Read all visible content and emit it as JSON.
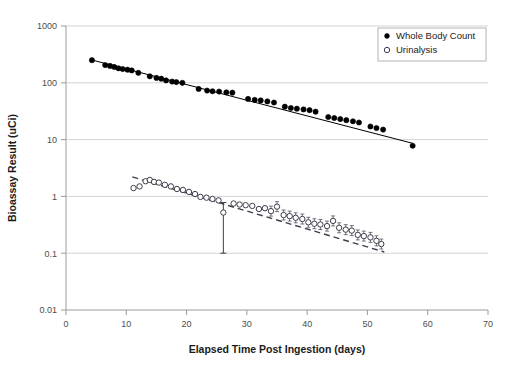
{
  "chart_data": {
    "type": "scatter",
    "title": "",
    "xlabel": "Elapsed Time Post Ingestion (days)",
    "ylabel": "Bioassay Result (uCi)",
    "xlim": [
      0,
      70
    ],
    "ylim": [
      0.01,
      1000
    ],
    "yscale": "log",
    "xscale": "linear",
    "grid": "horizontal-major",
    "legend_position": "top-right",
    "xticks": [
      "0",
      "10",
      "20",
      "30",
      "40",
      "50",
      "60",
      "70"
    ],
    "xtick_values": [
      0,
      10,
      20,
      30,
      40,
      50,
      60,
      70
    ],
    "yticks": [
      "0.01",
      "0.1",
      "1",
      "10",
      "100",
      "1000"
    ],
    "ytick_values": [
      0.01,
      0.1,
      1,
      10,
      100,
      1000
    ],
    "series": [
      {
        "name": "Whole Body Count",
        "marker": "filled-circle",
        "color": "#000000",
        "points": [
          [
            4.3,
            250
          ],
          [
            6.5,
            205
          ],
          [
            7.3,
            198
          ],
          [
            8.0,
            190
          ],
          [
            8.7,
            180
          ],
          [
            9.4,
            175
          ],
          [
            10.2,
            170
          ],
          [
            10.9,
            165
          ],
          [
            12.0,
            150
          ],
          [
            13.9,
            130
          ],
          [
            15.0,
            122
          ],
          [
            15.8,
            118
          ],
          [
            16.6,
            110
          ],
          [
            17.6,
            105
          ],
          [
            18.3,
            103
          ],
          [
            19.3,
            100
          ],
          [
            22.0,
            78
          ],
          [
            23.4,
            73
          ],
          [
            24.3,
            71
          ],
          [
            25.4,
            70
          ],
          [
            26.6,
            68
          ],
          [
            27.6,
            67
          ],
          [
            30.2,
            52
          ],
          [
            31.3,
            50
          ],
          [
            32.3,
            49
          ],
          [
            33.4,
            47
          ],
          [
            34.5,
            45
          ],
          [
            36.3,
            38
          ],
          [
            37.3,
            36
          ],
          [
            38.3,
            35
          ],
          [
            39.4,
            34
          ],
          [
            40.4,
            33
          ],
          [
            41.4,
            31
          ],
          [
            43.5,
            25
          ],
          [
            44.5,
            24
          ],
          [
            45.5,
            23
          ],
          [
            46.5,
            22
          ],
          [
            47.6,
            21
          ],
          [
            48.6,
            20
          ],
          [
            50.5,
            17
          ],
          [
            51.5,
            16
          ],
          [
            52.6,
            15
          ],
          [
            57.5,
            7.8
          ]
        ],
        "fit_line": {
          "style": "solid",
          "x0": 4.3,
          "y0": 252,
          "x1": 57.5,
          "y1": 8.6
        }
      },
      {
        "name": "Urinalysis",
        "marker": "open-circle",
        "color": "#3d3d4d",
        "points": [
          [
            11.2,
            1.4
          ],
          [
            12.2,
            1.5
          ],
          [
            13.2,
            1.85
          ],
          [
            13.9,
            1.95
          ],
          [
            14.6,
            1.8
          ],
          [
            15.4,
            1.75
          ],
          [
            16.4,
            1.6
          ],
          [
            17.4,
            1.5
          ],
          [
            18.4,
            1.35
          ],
          [
            19.4,
            1.3
          ],
          [
            20.4,
            1.2
          ],
          [
            21.4,
            1.1
          ],
          [
            22.3,
            0.98
          ],
          [
            23.3,
            0.95
          ],
          [
            24.3,
            0.9
          ],
          [
            25.3,
            0.85
          ],
          [
            26.1,
            0.52
          ],
          [
            27.8,
            0.75
          ],
          [
            28.8,
            0.72
          ],
          [
            29.8,
            0.7
          ],
          [
            30.9,
            0.68
          ],
          [
            32.0,
            0.6
          ],
          [
            33.0,
            0.62
          ],
          [
            34.0,
            0.55
          ],
          [
            35.0,
            0.66
          ],
          [
            36.1,
            0.47
          ],
          [
            37.1,
            0.45
          ],
          [
            38.1,
            0.42
          ],
          [
            39.2,
            0.4
          ],
          [
            40.2,
            0.35
          ],
          [
            41.2,
            0.33
          ],
          [
            42.2,
            0.32
          ],
          [
            43.3,
            0.3
          ],
          [
            44.3,
            0.37
          ],
          [
            45.3,
            0.28
          ],
          [
            46.4,
            0.26
          ],
          [
            47.4,
            0.25
          ],
          [
            48.4,
            0.21
          ],
          [
            49.4,
            0.2
          ],
          [
            50.5,
            0.19
          ],
          [
            51.5,
            0.165
          ],
          [
            52.3,
            0.145
          ]
        ],
        "fit_line": {
          "style": "dashed",
          "x0": 11.0,
          "y0": 2.2,
          "x1": 52.8,
          "y1": 0.105
        },
        "error_bar": {
          "x": 26.1,
          "y": 0.52,
          "low": 0.1,
          "high": 0.78
        }
      }
    ]
  },
  "legend": {
    "entries": [
      {
        "label": "Whole Body Count",
        "marker": "filled-circle"
      },
      {
        "label": "Urinalysis",
        "marker": "open-circle"
      }
    ]
  },
  "colors": {
    "axis": "#9a9a9a",
    "grid": "#d4d4d4",
    "text": "#1a1a1a",
    "tick_text": "#4d4d4d",
    "wbc": "#000000",
    "urine": "#3d3d4d"
  }
}
